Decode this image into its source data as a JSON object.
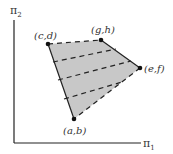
{
  "diagram": {
    "type": "feasible-region-polygon",
    "axes": {
      "x_label": "π",
      "x_sub": "1",
      "y_label": "π",
      "y_sub": "2"
    },
    "vertices": [
      {
        "id": "ab",
        "label": "(a,b)",
        "x": 74,
        "y": 119
      },
      {
        "id": "cd",
        "label": "(c,d)",
        "x": 48,
        "y": 44
      },
      {
        "id": "gh",
        "label": "(g,h)",
        "x": 101,
        "y": 40
      },
      {
        "id": "ef",
        "label": "(e,f)",
        "x": 140,
        "y": 68
      }
    ],
    "edges": [
      {
        "from": "ab",
        "to": "cd",
        "style": "solid"
      },
      {
        "from": "cd",
        "to": "gh",
        "style": "dashed"
      },
      {
        "from": "gh",
        "to": "ef",
        "style": "solid"
      },
      {
        "from": "ef",
        "to": "ab",
        "style": "dashed"
      }
    ],
    "interior_dashed_lines": 3,
    "colors": {
      "fill": "#c8c8c8",
      "stroke": "#222222"
    }
  }
}
